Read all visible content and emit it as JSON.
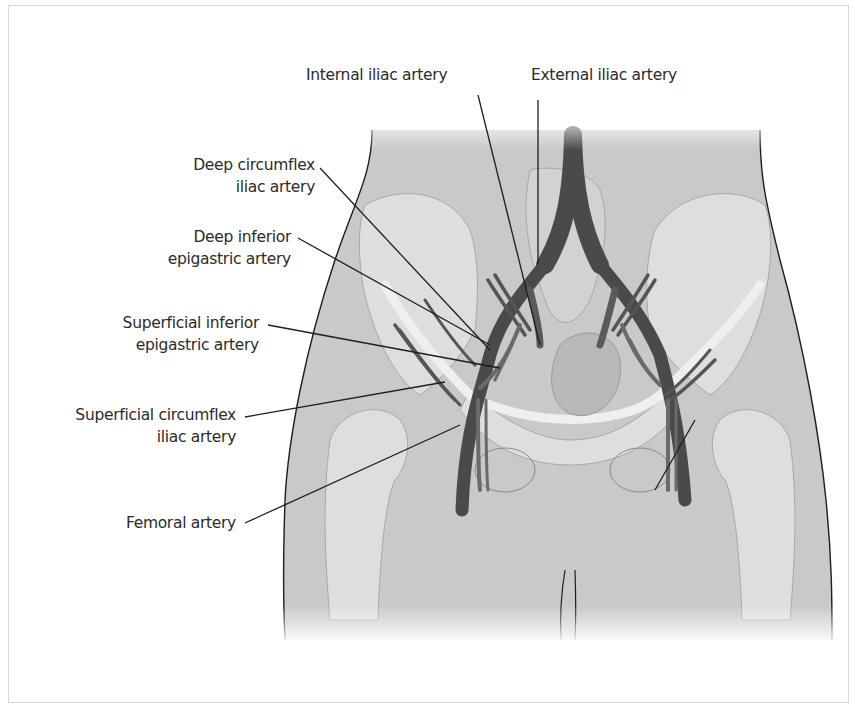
{
  "figure": {
    "colors": {
      "background": "#ffffff",
      "body_fill": "#c8c8c8",
      "bone_fill": "#dedede",
      "artery_fill": "#4a4a4a",
      "outline": "#1e1e1e",
      "label_text": "#2b2b2b",
      "frame_border": "#d8d8d8"
    }
  },
  "labels": {
    "internal_iliac": {
      "line1": "Internal iliac artery"
    },
    "external_iliac": {
      "line1": "External iliac artery"
    },
    "deep_circumflex_iliac": {
      "line1": "Deep circumflex",
      "line2": "iliac artery"
    },
    "deep_inferior_epigastric": {
      "line1": "Deep inferior",
      "line2": "epigastric artery"
    },
    "superficial_inferior_epigastric": {
      "line1": "Superficial inferior",
      "line2": "epigastric artery"
    },
    "superficial_circumflex_iliac": {
      "line1": "Superficial circumflex",
      "line2": "iliac artery"
    },
    "femoral": {
      "line1": "Femoral artery"
    }
  }
}
